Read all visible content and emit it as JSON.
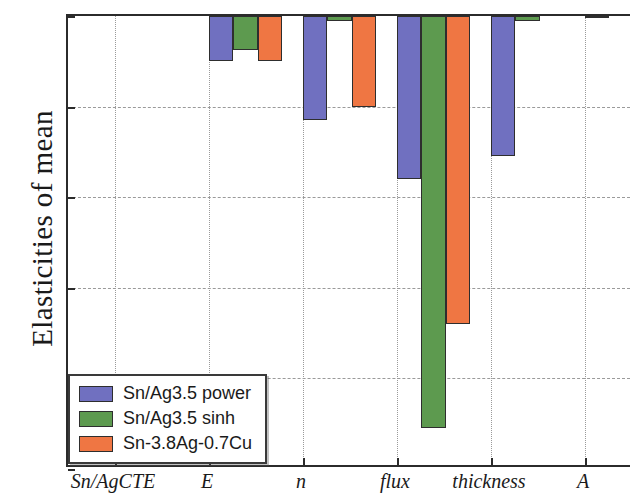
{
  "chart_data": {
    "type": "bar",
    "title": "",
    "xlabel": "",
    "ylabel": "Elasticities of mean",
    "categories": [
      "Sn/AgCTE",
      "E",
      "n",
      "flux",
      "thickness",
      "A"
    ],
    "series": [
      {
        "name": "Sn/Ag3.5 power",
        "color": "#7070c0",
        "values": [
          0.0,
          -0.1,
          -0.23,
          -0.36,
          -0.31,
          -0.005
        ]
      },
      {
        "name": "Sn/Ag3.5 sinh",
        "color": "#5d9a4f",
        "values": [
          0.0,
          -0.075,
          -0.012,
          -0.91,
          -0.012,
          0.0
        ]
      },
      {
        "name": "Sn-3.8Ag-0.7Cu",
        "color": "#ef7643",
        "values": [
          0.0,
          -0.1,
          -0.2,
          -0.68,
          0.0,
          -0.021
        ]
      }
    ],
    "ylim": [
      -1.0,
      0.0
    ],
    "yticks": [
      "0.0",
      "-0.2",
      "-0.4",
      "-0.6",
      "-0.8",
      "-1.0"
    ],
    "ytick_values": [
      0.0,
      -0.2,
      -0.4,
      -0.6,
      -0.8,
      -1.0
    ],
    "grid": true,
    "legend_position": "lower left"
  },
  "legend": {
    "entries": [
      {
        "label": "Sn/Ag3.5 power"
      },
      {
        "label": "Sn/Ag3.5 sinh"
      },
      {
        "label": "Sn-3.8Ag-0.7Cu"
      }
    ]
  }
}
